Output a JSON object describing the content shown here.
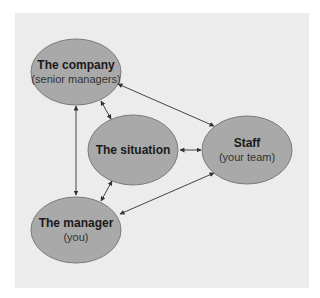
{
  "diagram": {
    "background": "#ececec",
    "node_fill": "#a9a9a9",
    "node_stroke": "#7a7a7a",
    "nodes": [
      {
        "id": "company",
        "title": "The company",
        "subtitle": "(senior managers)"
      },
      {
        "id": "situation",
        "title": "The situation",
        "subtitle": ""
      },
      {
        "id": "staff",
        "title": "Staff",
        "subtitle": "(your team)"
      },
      {
        "id": "manager",
        "title": "The manager",
        "subtitle": "(you)"
      }
    ],
    "edges": [
      {
        "from": "company",
        "to": "manager",
        "direction": "both"
      },
      {
        "from": "company",
        "to": "situation",
        "direction": "both"
      },
      {
        "from": "company",
        "to": "staff",
        "direction": "both"
      },
      {
        "from": "situation",
        "to": "staff",
        "direction": "both"
      },
      {
        "from": "situation",
        "to": "manager",
        "direction": "both"
      },
      {
        "from": "staff",
        "to": "manager",
        "direction": "both"
      }
    ]
  }
}
